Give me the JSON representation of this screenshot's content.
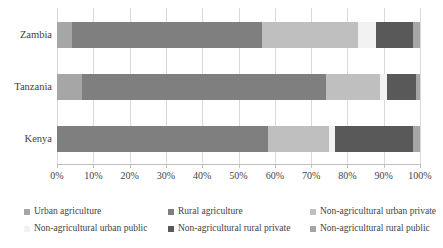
{
  "chart_data": {
    "type": "bar",
    "orientation": "horizontal",
    "stacked": true,
    "stack_mode": "percent",
    "title": "",
    "xlabel": "",
    "ylabel": "",
    "xlim": [
      0,
      100
    ],
    "grid": true,
    "legend_position": "bottom",
    "categories": [
      "Zambia",
      "Tanzania",
      "Kenya"
    ],
    "xtick_labels": [
      "0%",
      "10%",
      "20%",
      "30%",
      "40%",
      "50%",
      "60%",
      "70%",
      "80%",
      "90%",
      "100%"
    ],
    "xtick_values": [
      0,
      10,
      20,
      30,
      40,
      50,
      60,
      70,
      80,
      90,
      100
    ],
    "series": [
      {
        "name": "Urban agriculture",
        "color": "#a6a6a6",
        "values": [
          4,
          7,
          0
        ]
      },
      {
        "name": "Rural agriculture",
        "color": "#7f7f7f",
        "values": [
          52.5,
          67,
          58
        ]
      },
      {
        "name": "Non-agricultural urban private",
        "color": "#bfbfbf",
        "values": [
          26.5,
          15,
          17
        ]
      },
      {
        "name": "Non-agricultural urban public",
        "color": "#f2f2f2",
        "values": [
          5,
          2,
          1.5
        ]
      },
      {
        "name": "Non-agricultural rural private",
        "color": "#595959",
        "values": [
          10,
          8,
          21.5
        ]
      },
      {
        "name": "Non-agricultural rural public",
        "color": "#a6a6a6",
        "values": [
          2,
          1,
          2
        ]
      }
    ]
  },
  "colors": {
    "gridline": "#d9d9d9",
    "axis": "#bfbfbf",
    "text": "#3f3f3f",
    "background": "#ffffff"
  }
}
